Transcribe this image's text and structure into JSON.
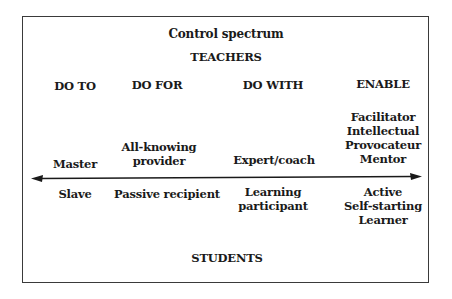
{
  "diagram": {
    "title": "Control spectrum",
    "top_label": "TEACHERS",
    "bottom_label": "STUDENTS",
    "columns": [
      {
        "heading": "DO TO",
        "teacher_role": [
          "Master"
        ],
        "student_role": [
          "Slave"
        ]
      },
      {
        "heading": "DO FOR",
        "teacher_role": [
          "All-knowing",
          "provider"
        ],
        "student_role": [
          "Passive recipient"
        ]
      },
      {
        "heading": "DO WITH",
        "teacher_role": [
          "Expert/coach"
        ],
        "student_role": [
          "Learning",
          "participant"
        ]
      },
      {
        "heading": "ENABLE",
        "teacher_role": [
          "Facilitator",
          "Intellectual",
          "Provocateur",
          "Mentor"
        ],
        "student_role": [
          "Active",
          "Self-starting",
          "Learner"
        ]
      }
    ],
    "arrow": {
      "type": "double-headed",
      "color": "#1a1a1a"
    },
    "colors": {
      "text": "#1a1a1a",
      "border": "#3a3a3a",
      "background": "#ffffff"
    }
  }
}
